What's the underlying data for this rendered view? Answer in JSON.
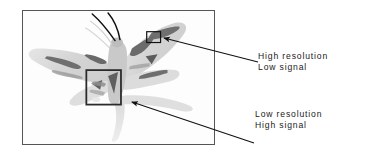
{
  "figure": {
    "type": "annotated-micrograph",
    "background_color": "#ffffff",
    "frame": {
      "border_color": "#555555",
      "x": 22,
      "y": 10,
      "width": 193,
      "height": 135
    },
    "specimen": {
      "name": "moth",
      "description": "grayscale micrograph of a moth with outspread wings, antennae and a pale trailing abdomen",
      "body_color": "#d2d2d2",
      "marking_color": "#6f6f6f",
      "antenna_color": "#111111"
    },
    "regions_of_interest": [
      {
        "id": "roi-small",
        "label": "high-resolution-region",
        "outline_color": "#111111",
        "x": 147,
        "y": 31,
        "width": 14,
        "height": 11
      },
      {
        "id": "roi-large",
        "label": "low-resolution-region",
        "outline_color": "#2b2b2b",
        "x": 86,
        "y": 70,
        "width": 35,
        "height": 35
      }
    ]
  },
  "annotations": [
    {
      "id": "high-res",
      "lines": [
        "High resolution",
        "Low signal"
      ],
      "text_color": "#1a1a1a",
      "arrow": {
        "from_x": 258,
        "from_y": 62,
        "to_x": 163,
        "to_y": 38,
        "color": "#111111"
      }
    },
    {
      "id": "low-res",
      "lines": [
        "Low resolution",
        "High signal"
      ],
      "text_color": "#1a1a1a",
      "arrow": {
        "from_x": 254,
        "from_y": 143,
        "to_x": 131,
        "to_y": 102,
        "color": "#111111"
      }
    }
  ]
}
